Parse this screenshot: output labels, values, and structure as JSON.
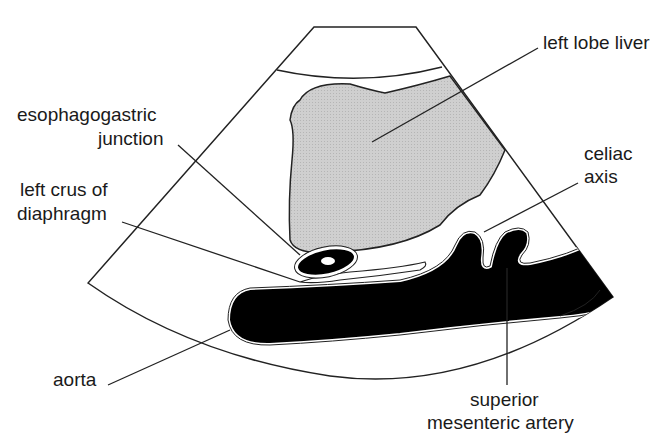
{
  "diagram": {
    "type": "ultrasound-anatomy-schematic",
    "colors": {
      "liver": "#c9c9c9",
      "vessel": "#000000",
      "outline": "#222222",
      "background": "#ffffff"
    },
    "labels": {
      "left_lobe_liver": "left lobe liver",
      "esophagogastric_1": "esophagogastric",
      "esophagogastric_2": "junction",
      "left_crus_1": "left crus of",
      "left_crus_2": "diaphragm",
      "celiac_1": "celiac",
      "celiac_2": "axis",
      "aorta": "aorta",
      "sma_1": "superior",
      "sma_2": "mesenteric artery"
    }
  }
}
